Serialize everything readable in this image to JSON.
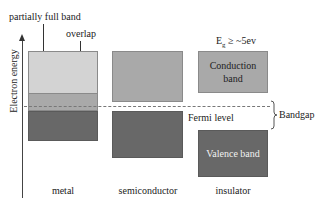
{
  "diagram": {
    "y_axis_label": "Electron energy",
    "annotations": {
      "partially_full_band": "partially full band",
      "overlap": "overlap",
      "eg": "E",
      "eg_sub": "g",
      "eg_rest": " ≥ ~5ev",
      "fermi_level": "Fermi level",
      "bandgap": "Bandgap"
    },
    "bands": {
      "conduction": "Conduction band",
      "conduction_line1": "Conduction",
      "conduction_line2": "band",
      "valence": "Valence band"
    },
    "materials": [
      "metal",
      "semiconductor",
      "insulator"
    ],
    "colors": {
      "light_band": "#d3d3d3",
      "mid_band": "#a9a9a9",
      "dark_band": "#686868"
    }
  }
}
